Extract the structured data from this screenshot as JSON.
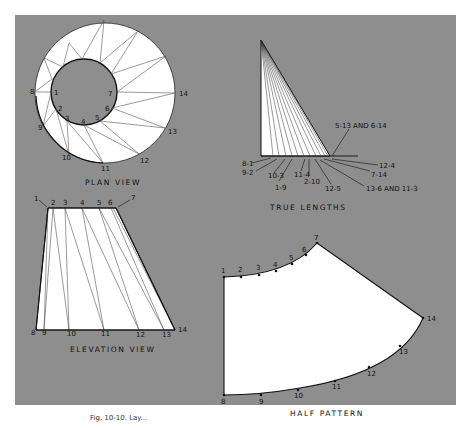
{
  "figure": {
    "background_color": "#8e8e8e",
    "surface_color": "#ffffff",
    "caption": "Fig. 10-10. Lay..."
  },
  "plan_view": {
    "title": "PLAN VIEW",
    "outer_points": [
      "8",
      "9",
      "10",
      "11",
      "12",
      "13",
      "14"
    ],
    "inner_points": [
      "1",
      "2",
      "3",
      "4",
      "5",
      "6",
      "7"
    ],
    "labels": {
      "p1": "1",
      "p2": "2",
      "p3": "3",
      "p4": "4",
      "p5": "5",
      "p6": "6",
      "p7": "7",
      "p8": "8",
      "p9": "9",
      "p10": "10",
      "p11": "11",
      "p12": "12",
      "p13": "13",
      "p14": "14"
    }
  },
  "true_lengths": {
    "title": "TRUE LENGTHS",
    "labels": {
      "l_8_1": "8-1",
      "l_9_2": "9-2",
      "l_10_3": "10-3",
      "l_1_9": "1-9",
      "l_11_4": "11-4",
      "l_2_10": "2-10",
      "l_12_5": "12-5",
      "l_5_13": "5-13 AND 6-14",
      "l_12_4": "12-4",
      "l_7_14": "7-14",
      "l_13_6": "13-6 AND 11-3"
    }
  },
  "elevation_view": {
    "title": "ELEVATION VIEW",
    "labels": {
      "p1": "1",
      "p2": "2",
      "p3": "3",
      "p4": "4",
      "p5": "5",
      "p6": "6",
      "p7": "7",
      "p8": "8",
      "p9": "9",
      "p10": "10",
      "p11": "11",
      "p12": "12",
      "p13": "13",
      "p14": "14"
    }
  },
  "half_pattern": {
    "title": "HALF PATTERN",
    "labels": {
      "p1": "1",
      "p2": "2",
      "p3": "3",
      "p4": "4",
      "p5": "5",
      "p6": "6",
      "p7": "7",
      "p8": "8",
      "p9": "9",
      "p10": "10",
      "p11": "11",
      "p12": "12",
      "p13": "13",
      "p14": "14"
    }
  }
}
